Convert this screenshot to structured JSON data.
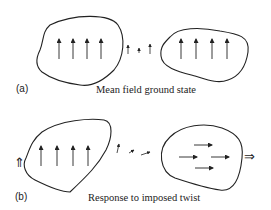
{
  "panels": [
    {
      "label": "(a)",
      "caption": "Mean field ground state",
      "left_region": {
        "arrows": [
          "up",
          "up",
          "up",
          "up"
        ]
      },
      "bridge_arrows": [
        "up-small",
        "up-tiny",
        "up-small"
      ],
      "right_region": {
        "arrows": [
          "up",
          "up",
          "up",
          "up"
        ]
      }
    },
    {
      "label": "(b)",
      "caption": "Response to imposed twist",
      "left_boundary_indicator": "double-arrow-up",
      "left_region": {
        "arrows": [
          "up",
          "up",
          "up",
          "up"
        ]
      },
      "bridge_arrows": [
        "tilted-up-right",
        "tilted-right-short",
        "right-short"
      ],
      "right_region": {
        "arrows": [
          "right",
          "right",
          "right",
          "right"
        ]
      },
      "right_boundary_indicator": "double-arrow-right"
    }
  ],
  "colors": {
    "ink": "#222222",
    "background": "#ffffff"
  }
}
